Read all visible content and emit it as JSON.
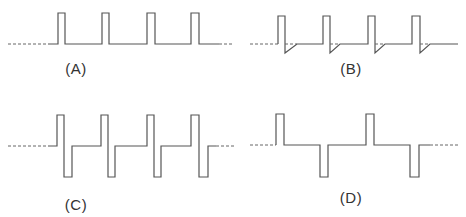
{
  "diagram": {
    "panels": [
      {
        "id": "A",
        "label": "(A)",
        "description": "Unipolar positive pulse train"
      },
      {
        "id": "B",
        "label": "(B)",
        "description": "Positive pulses with negative overshoot and exponential recovery"
      },
      {
        "id": "C",
        "label": "(C)",
        "description": "Biphasic pulses: positive then negative"
      },
      {
        "id": "D",
        "label": "(D)",
        "description": "Alternating positive and negative pulses"
      }
    ],
    "stroke_color": "#555555",
    "background": "#ffffff"
  }
}
